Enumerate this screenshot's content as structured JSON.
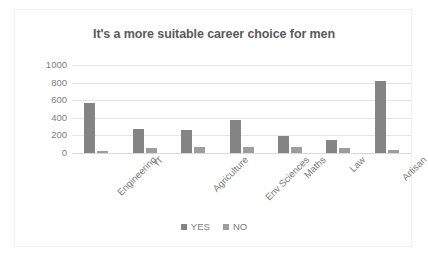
{
  "chart_data": {
    "type": "bar",
    "title": "It's a more suitable career choice for men",
    "xlabel": "",
    "ylabel": "",
    "ylim": [
      0,
      1000
    ],
    "yticks": [
      0,
      200,
      400,
      600,
      800,
      1000
    ],
    "ytick_labels": [
      "1000",
      "800",
      "600",
      "400",
      "200",
      "0"
    ],
    "grid": true,
    "legend_position": "bottom",
    "categories": [
      "Engineering",
      "IT",
      "Agriculture",
      "Env Sciences",
      "Maths",
      "Law",
      "Artisan"
    ],
    "series": [
      {
        "name": "YES",
        "color": "#848484",
        "values": [
          565,
          270,
          260,
          370,
          190,
          150,
          820
        ]
      },
      {
        "name": "NO",
        "color": "#9d9d9d",
        "values": [
          20,
          60,
          70,
          65,
          65,
          55,
          30
        ]
      }
    ]
  },
  "legend": {
    "items": [
      {
        "label": "YES",
        "color": "#848484"
      },
      {
        "label": "NO",
        "color": "#9d9d9d"
      }
    ]
  },
  "colors": {
    "title": "#5a5a5a",
    "tick_text": "#7d7d7d",
    "gridline": "#e4e4e4",
    "plot_background": "#ffffff",
    "frame_border": "#f0f0f0"
  }
}
